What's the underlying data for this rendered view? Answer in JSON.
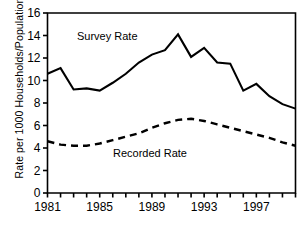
{
  "chart_data": {
    "type": "line",
    "title": "",
    "xlabel": "",
    "ylabel": "Rate per 1000 Households/Population",
    "xlim": [
      1981,
      2000
    ],
    "ylim": [
      0,
      16
    ],
    "ytick_step": 2,
    "yticks": [
      0,
      2,
      4,
      6,
      8,
      10,
      12,
      14,
      16
    ],
    "ytick_labels": [
      "0",
      "2",
      "4",
      "6",
      "8",
      "10",
      "12",
      "14",
      "16"
    ],
    "xticks": [
      1981,
      1982,
      1983,
      1984,
      1985,
      1986,
      1987,
      1988,
      1989,
      1990,
      1991,
      1992,
      1993,
      1994,
      1995,
      1996,
      1997,
      1998,
      1999,
      2000
    ],
    "xtick_labels_shown": [
      "1981",
      "1985",
      "1989",
      "1993",
      "1997"
    ],
    "xtick_labels_shown_values": [
      1981,
      1985,
      1989,
      1993,
      1997
    ],
    "grid": false,
    "legend_position": "inline-annotations",
    "x": [
      1981,
      1982,
      1983,
      1984,
      1985,
      1986,
      1987,
      1988,
      1989,
      1990,
      1991,
      1992,
      1993,
      1994,
      1995,
      1996,
      1997,
      1998,
      1999,
      2000
    ],
    "series": [
      {
        "name": "Survey Rate",
        "style": "solid",
        "color": "#000000",
        "annotation": "Survey Rate",
        "values": [
          10.6,
          11.1,
          9.2,
          9.3,
          9.1,
          9.8,
          10.6,
          11.6,
          12.3,
          12.7,
          14.1,
          12.1,
          12.9,
          11.6,
          11.5,
          9.1,
          9.7,
          8.6,
          7.9,
          7.5
        ]
      },
      {
        "name": "Recorded Rate",
        "style": "dashed",
        "color": "#000000",
        "annotation": "Recorded Rate",
        "values": [
          4.6,
          4.3,
          4.2,
          4.2,
          4.4,
          4.7,
          5.0,
          5.3,
          5.8,
          6.2,
          6.5,
          6.6,
          6.4,
          6.1,
          5.8,
          5.5,
          5.2,
          4.9,
          4.5,
          4.2
        ]
      }
    ]
  },
  "annotations": {
    "survey_label": "Survey Rate",
    "recorded_label": "Recorded Rate"
  },
  "axis": {
    "y_title": "Rate per 1000 Households/Population"
  },
  "colors": {
    "axis": "#000000",
    "line": "#000000",
    "background": "#ffffff"
  }
}
